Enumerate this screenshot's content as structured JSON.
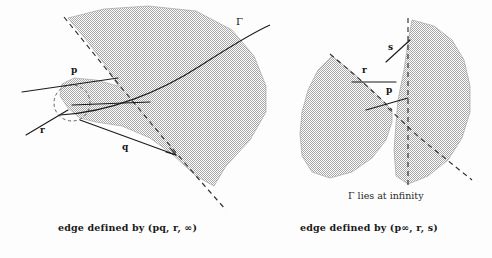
{
  "figure": {
    "title": "",
    "background_color": "#fdfdfd",
    "fill_color": "#c9c9c9",
    "line_color": "#1b1b1b",
    "dash_color": "#333333"
  },
  "panels": [
    {
      "id": "left",
      "caption": "edge defined by (pq, r, ∞)",
      "labels": {
        "p": "p",
        "q": "q",
        "r": "r",
        "gamma": "Γ"
      }
    },
    {
      "id": "right",
      "caption": "edge defined by (p∞, r, s)",
      "note": "Γ lies at infinity",
      "labels": {
        "p": "p",
        "r": "r",
        "s": "s"
      }
    }
  ]
}
